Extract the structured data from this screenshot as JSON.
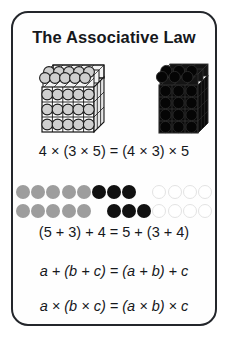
{
  "card": {
    "title": "The Associative Law",
    "border_color": "#23262b",
    "background_color": "#fefefe"
  },
  "illustrations": {
    "left_block": {
      "name": "light-cube-4x3x5",
      "sphere_fill": "#cfcfcf",
      "frame_color": "#1a1a1a",
      "cols": 5,
      "rows": 3,
      "depth": 4
    },
    "right_block": {
      "name": "dark-cube-4x3x5",
      "sphere_fill": "#050505",
      "frame_color": "#0d0d0d",
      "cols": 3,
      "rows": 4,
      "depth": 5
    }
  },
  "equations": {
    "multiplication_numeric": "4 × (3 × 5) = (4 × 3) × 5",
    "addition_numeric": "(5 + 3) + 4 = 5 + (3 + 4)",
    "addition_algebraic": "a + (b + c) = (a + b) + c",
    "multiplication_algebraic": "a × (b × c) = (a × b) × c"
  },
  "dot_diagram": {
    "colors": {
      "gray": "#9d9d9d",
      "black": "#111111",
      "white": "#ffffff"
    },
    "rows": [
      {
        "label": "row-grouped-left",
        "groups": [
          {
            "color": "gray",
            "count": 5,
            "gap_after": "none"
          },
          {
            "color": "black",
            "count": 3,
            "gap_after": "large"
          },
          {
            "color": "white",
            "count": 4,
            "gap_after": "none"
          }
        ]
      },
      {
        "label": "row-grouped-right",
        "groups": [
          {
            "color": "gray",
            "count": 5,
            "gap_after": "large"
          },
          {
            "color": "black",
            "count": 3,
            "gap_after": "none"
          },
          {
            "color": "white",
            "count": 4,
            "gap_after": "none"
          }
        ]
      }
    ]
  }
}
